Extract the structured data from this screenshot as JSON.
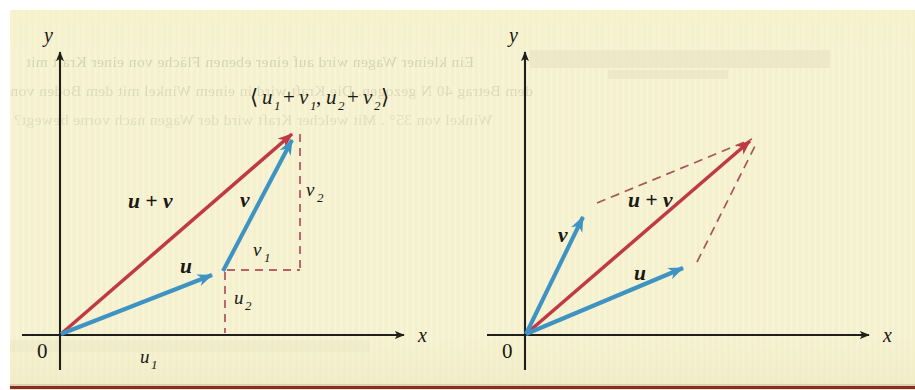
{
  "figure": {
    "kind": "vector-addition-diagram",
    "panel_count": 2,
    "background_color": "#f6f2cf",
    "paper_margin_color": "#ffffff",
    "bottom_rule_color": "#8e2b26",
    "vector_blue": "#3e93c2",
    "vector_red": "#bf3a43",
    "dashed_red": "#b9616a",
    "axis_color": "#211f1c"
  },
  "left_panel": {
    "name": "triangle-law",
    "axis_x_label": "x",
    "axis_y_label": "y",
    "origin_label": "0",
    "coordinate_label": {
      "open": "⟨",
      "u1": "u",
      "u1_sub": "1",
      "plus1": "+",
      "v1": "v",
      "v1_sub": "1",
      "comma": ",",
      "u2": "u",
      "u2_sub": "2",
      "plus2": "+",
      "v2": "v",
      "v2_sub": "2",
      "close": "⟩",
      "full_text": "⟨u₁ + v₁, u₂ + v₂⟩"
    },
    "vectors": [
      {
        "label": "u",
        "label_text": "u",
        "color": "#3e93c2",
        "style": "solid",
        "from": [
          0,
          0
        ],
        "to": [
          165,
          65
        ],
        "kind": "component-vector"
      },
      {
        "label": "v",
        "label_text": "v",
        "color": "#3e93c2",
        "style": "solid",
        "from": [
          165,
          65
        ],
        "to": [
          240,
          207
        ],
        "kind": "component-vector"
      },
      {
        "label": "u + v",
        "label_text": "u + v",
        "color": "#bf3a43",
        "style": "solid",
        "from": [
          0,
          0
        ],
        "to": [
          240,
          207
        ],
        "kind": "resultant"
      }
    ],
    "components": [
      {
        "label": "u",
        "sub": "1",
        "text": "u₁",
        "axis": "x",
        "of": "u"
      },
      {
        "label": "u",
        "sub": "2",
        "text": "u₂",
        "axis": "y",
        "of": "u"
      },
      {
        "label": "v",
        "sub": "1",
        "text": "v₁",
        "axis": "x",
        "of": "v"
      },
      {
        "label": "v",
        "sub": "2",
        "text": "v₂",
        "axis": "y",
        "of": "v"
      }
    ]
  },
  "right_panel": {
    "name": "parallelogram-law",
    "axis_x_label": "x",
    "axis_y_label": "y",
    "origin_label": "0",
    "vectors": [
      {
        "label": "v",
        "label_text": "v",
        "color": "#3e93c2",
        "style": "solid",
        "from": [
          0,
          0
        ],
        "to": [
          65,
          130
        ],
        "kind": "addend"
      },
      {
        "label": "u",
        "label_text": "u",
        "color": "#3e93c2",
        "style": "solid",
        "from": [
          0,
          0
        ],
        "to": [
          165,
          70
        ],
        "kind": "addend"
      },
      {
        "label": "u + v",
        "label_text": "u + v",
        "color": "#bf3a43",
        "style": "solid",
        "from": [
          0,
          0
        ],
        "to": [
          235,
          203
        ],
        "kind": "resultant-diagonal"
      }
    ],
    "dashed_sides": [
      {
        "from": [
          65,
          130
        ],
        "to": [
          235,
          203
        ],
        "style": "dashed"
      },
      {
        "from": [
          165,
          70
        ],
        "to": [
          235,
          203
        ],
        "style": "dashed"
      }
    ]
  },
  "showthrough_text": {
    "note": "faint mirrored German text bleeding through from the reverse page side",
    "lines": [
      "Ein kleiner Wagen wird auf einer ebenen Fläche von einer Kraft mit",
      "dem Betrag 40 N gezogen. Die Kraft wird in einem Winkel mit dem Boden von",
      "Winkel von 35° . Mit welcher Kraft wird der Wagen nach vorne bewegt?"
    ]
  }
}
